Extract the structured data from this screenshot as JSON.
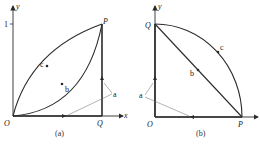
{
  "panels": [
    {
      "id": "a",
      "caption": "(a)",
      "axis_x": "x",
      "axis_y": "y",
      "origin": "O",
      "points": {
        "P": "P",
        "Q": "Q"
      },
      "tick_y": "1",
      "paths": {
        "a": "a",
        "b": "b",
        "c": "c"
      }
    },
    {
      "id": "b",
      "caption": "(b)",
      "axis_x": "x",
      "axis_y": "y",
      "origin": "O",
      "points": {
        "P": "P",
        "Q": "Q"
      },
      "paths": {
        "a": "a",
        "b": "b",
        "c": "c"
      }
    }
  ],
  "colors": {
    "line": "#2a2a2a",
    "thin": "#555555"
  }
}
